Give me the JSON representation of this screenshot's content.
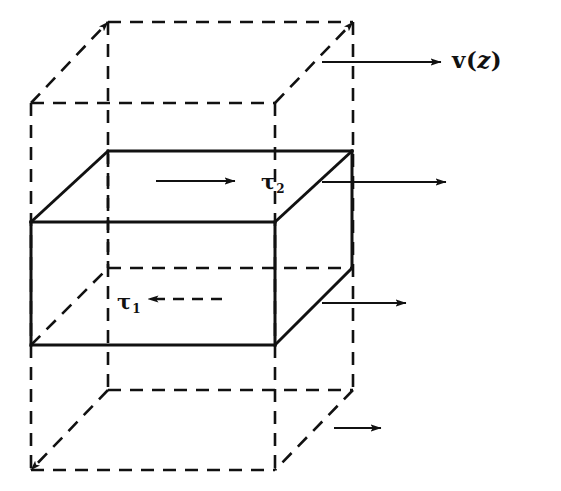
{
  "figure": {
    "kind": "fluid-shear-stress-control-volume-diagram",
    "background_color": "#ffffff",
    "ink_color": "#111111"
  },
  "labels": {
    "velocity": {
      "name": "velocity-profile-label",
      "prefix": "v",
      "open_paren": "(",
      "variable": "z",
      "close_paren": ")",
      "full_text": "v(z)",
      "x": 452,
      "y": 48
    },
    "tau_upper": {
      "name": "shear-stress-tau2-label",
      "symbol": "τ",
      "subscript": "2",
      "full_text": "τ2",
      "x": 261,
      "y": 171
    },
    "tau_lower": {
      "name": "shear-stress-tau1-label",
      "symbol": "τ",
      "subscript": "1",
      "full_text": "τ1",
      "x": 117,
      "y": 291
    }
  },
  "geometry": {
    "outer_box": {
      "name": "outer-dashed-control-volume",
      "style": "dashed",
      "front_face": {
        "left": 31,
        "right": 275,
        "top": 103,
        "bottom": 470
      },
      "back_face": {
        "left": 108,
        "right": 353,
        "top": 22,
        "bottom": 390
      }
    },
    "inner_box": {
      "name": "inner-solid-fluid-element",
      "style": "solid",
      "front_face": {
        "left": 31,
        "right": 275,
        "top": 222,
        "bottom": 345
      },
      "back_face": {
        "left": 108,
        "right": 352,
        "top": 151,
        "bottom": 268
      }
    }
  },
  "arrows": {
    "velocity_top": {
      "name": "velocity-arrow-top",
      "style": "solid",
      "direction": "right",
      "x1": 322,
      "y1": 62,
      "x2": 441,
      "y2": 62
    },
    "velocity_mid": {
      "name": "velocity-arrow-middle",
      "style": "solid",
      "direction": "right",
      "x1": 322,
      "y1": 182,
      "x2": 446,
      "y2": 182
    },
    "velocity_low": {
      "name": "velocity-arrow-lower",
      "style": "solid",
      "direction": "right",
      "x1": 322,
      "y1": 303,
      "x2": 406,
      "y2": 303
    },
    "velocity_bottom": {
      "name": "velocity-arrow-bottom",
      "style": "solid",
      "direction": "right",
      "x1": 334,
      "y1": 428,
      "x2": 381,
      "y2": 428
    },
    "tau_upper_arrow": {
      "name": "tau2-shear-arrow",
      "style": "solid",
      "direction": "right",
      "x1": 156,
      "y1": 181,
      "x2": 235,
      "y2": 181
    },
    "tau_lower_arrow": {
      "name": "tau1-shear-arrow",
      "style": "dashed",
      "direction": "left",
      "x1": 222,
      "y1": 299,
      "x2": 148,
      "y2": 299
    }
  }
}
